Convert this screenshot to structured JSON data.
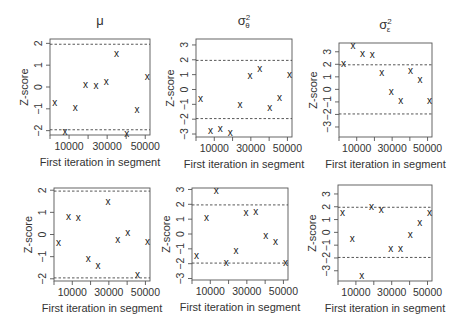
{
  "figure": {
    "ref_line_label": "|Z| = 2 reference",
    "marker_glyph": "x"
  },
  "chart_data": [
    {
      "type": "scatter",
      "title": "μ",
      "title_base": "μ",
      "title_sup": "",
      "title_sub": "",
      "xlabel": "First iteration in segment",
      "ylabel": "Z-score",
      "xticks": [
        10000,
        30000,
        50000
      ],
      "xtick_labels": [
        "10000",
        "30000",
        "50000"
      ],
      "yticks": [
        -2,
        -1,
        0,
        1,
        2
      ],
      "ytick_labels": [
        "-2",
        "-1",
        "0",
        "1",
        "2"
      ],
      "xlim": [
        0,
        52500
      ],
      "ylim": [
        -2.2,
        2.2
      ],
      "ref_lines": [
        -1.96,
        1.96
      ],
      "grid": false,
      "x": [
        2500,
        7900,
        13300,
        18700,
        24100,
        29500,
        34900,
        40300,
        45700,
        51100
      ],
      "y": [
        -0.69,
        -2.02,
        -0.94,
        0.11,
        0.06,
        0.23,
        1.55,
        -2.11,
        -1.05,
        0.48
      ],
      "box": {
        "left": 50,
        "top": 39,
        "right": 150,
        "bottom": 135
      }
    },
    {
      "type": "scatter",
      "title": "σ²θ",
      "title_base": "σ",
      "title_sup": "2",
      "title_sub": "θ",
      "xlabel": "First iteration in segment",
      "ylabel": "Z-score",
      "xticks": [
        10000,
        30000,
        50000
      ],
      "xtick_labels": [
        "10000",
        "30000",
        "50000"
      ],
      "yticks": [
        -3,
        -2,
        -1,
        0,
        1,
        2,
        3
      ],
      "ytick_labels": [
        "-3",
        "-2",
        "-1",
        "0",
        "1",
        "2",
        "3"
      ],
      "xlim": [
        0,
        52500
      ],
      "ylim": [
        -3.2,
        3.4
      ],
      "ref_lines": [
        -1.96,
        1.96
      ],
      "grid": false,
      "x": [
        2500,
        7900,
        13300,
        18700,
        24100,
        29500,
        34900,
        40300,
        45700,
        51100
      ],
      "y": [
        -0.6,
        -2.78,
        -2.65,
        -2.91,
        -1.02,
        0.91,
        1.44,
        -1.2,
        -0.52,
        1.02
      ],
      "box": {
        "left": 196,
        "top": 39,
        "right": 292,
        "bottom": 137
      }
    },
    {
      "type": "scatter",
      "title": "σ²ε",
      "title_base": "σ",
      "title_sup": "2",
      "title_sub": "ε",
      "xlabel": "First iteration in segment",
      "ylabel": "Z-score",
      "xticks": [
        10000,
        30000,
        50000
      ],
      "xtick_labels": [
        "10000",
        "30000",
        "50000"
      ],
      "yticks": [
        -3,
        -2,
        -1,
        0,
        1,
        2,
        3
      ],
      "ytick_labels": [
        "-3",
        "-2",
        "-1",
        "0",
        "1",
        "2",
        "3"
      ],
      "xlim": [
        0,
        52500
      ],
      "ylim": [
        -3.8,
        3.7
      ],
      "ref_lines": [
        -1.96,
        1.96
      ],
      "grid": false,
      "x": [
        2500,
        7900,
        13300,
        18700,
        24100,
        29500,
        34900,
        40300,
        45700,
        51100
      ],
      "y": [
        2.1,
        3.5,
        2.83,
        2.8,
        1.38,
        -0.2,
        -0.9,
        1.5,
        0.8,
        -0.9
      ],
      "box": {
        "left": 339,
        "top": 43,
        "right": 432,
        "bottom": 137
      }
    },
    {
      "type": "scatter",
      "title": "",
      "title_base": "",
      "title_sup": "",
      "title_sub": "",
      "xlabel": "First iteration in segment",
      "ylabel": "Z-score",
      "xticks": [
        10000,
        30000,
        50000
      ],
      "xtick_labels": [
        "10000",
        "30000",
        "50000"
      ],
      "yticks": [
        -2,
        -1,
        0,
        1,
        2
      ],
      "ytick_labels": [
        "-2",
        "-1",
        "0",
        "1",
        "2"
      ],
      "xlim": [
        0,
        52500
      ],
      "ylim": [
        -2.1,
        2.1
      ],
      "ref_lines": [
        -1.96,
        1.96
      ],
      "grid": false,
      "x": [
        2500,
        7900,
        13300,
        18700,
        24100,
        29500,
        34900,
        40300,
        45700,
        51100
      ],
      "y": [
        -0.34,
        0.82,
        0.78,
        -1.07,
        -1.39,
        1.49,
        -0.24,
        0.1,
        -1.81,
        -0.3
      ],
      "box": {
        "left": 54,
        "top": 188,
        "right": 150,
        "bottom": 281
      }
    },
    {
      "type": "scatter",
      "title": "",
      "title_base": "",
      "title_sup": "",
      "title_sub": "",
      "xlabel": "First iteration in segment",
      "ylabel": "Z-score",
      "xticks": [
        10000,
        30000,
        50000
      ],
      "xtick_labels": [
        "10000",
        "30000",
        "50000"
      ],
      "yticks": [
        -3,
        -2,
        -1,
        0,
        1,
        2,
        3
      ],
      "ytick_labels": [
        "-3",
        "-2",
        "-1",
        "0",
        "1",
        "2",
        "3"
      ],
      "xlim": [
        0,
        52500
      ],
      "ylim": [
        -3.1,
        3.1
      ],
      "ref_lines": [
        -1.96,
        1.96
      ],
      "grid": false,
      "x": [
        2500,
        7900,
        13300,
        18700,
        24100,
        29500,
        34900,
        40300,
        45700,
        51100
      ],
      "y": [
        -1.44,
        1.09,
        2.91,
        -1.91,
        -1.13,
        1.42,
        1.49,
        -0.09,
        -0.51,
        -1.93
      ],
      "box": {
        "left": 192,
        "top": 188,
        "right": 288,
        "bottom": 280
      }
    },
    {
      "type": "scatter",
      "title": "",
      "title_base": "",
      "title_sup": "",
      "title_sub": "",
      "xlabel": "First iteration in segment",
      "ylabel": "Z-score",
      "xticks": [
        10000,
        30000,
        50000
      ],
      "xtick_labels": [
        "10000",
        "30000",
        "50000"
      ],
      "yticks": [
        -3,
        -2,
        -1,
        0,
        1,
        2,
        3
      ],
      "ytick_labels": [
        "-3",
        "-2",
        "-1",
        "0",
        "1",
        "2",
        "3"
      ],
      "xlim": [
        0,
        52500
      ],
      "ylim": [
        -3.8,
        3.7
      ],
      "ref_lines": [
        -1.96,
        1.96
      ],
      "grid": false,
      "x": [
        2500,
        7900,
        13300,
        18700,
        24100,
        29500,
        34900,
        40300,
        45700,
        51100
      ],
      "y": [
        1.54,
        -0.47,
        -3.35,
        2.0,
        1.75,
        -1.25,
        -1.27,
        -0.2,
        0.76,
        1.54
      ],
      "box": {
        "left": 338,
        "top": 185,
        "right": 432,
        "bottom": 281
      }
    }
  ]
}
